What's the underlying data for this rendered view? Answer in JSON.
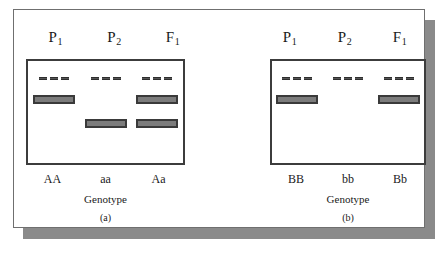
{
  "figure": {
    "panels": [
      {
        "id": "a",
        "caption": "(a)",
        "axis_title": "Genotype",
        "lane_headers": [
          {
            "symbol": "P",
            "subscript": "1"
          },
          {
            "symbol": "P",
            "subscript": "2"
          },
          {
            "symbol": "F",
            "subscript": "1"
          }
        ],
        "lanes": [
          {
            "genotype": "AA",
            "wells": 3,
            "bands": [
              "high"
            ]
          },
          {
            "genotype": "aa",
            "wells": 3,
            "bands": [
              "low"
            ]
          },
          {
            "genotype": "Aa",
            "wells": 3,
            "bands": [
              "high",
              "low"
            ]
          }
        ]
      },
      {
        "id": "b",
        "caption": "(b)",
        "axis_title": "Genotype",
        "lane_headers": [
          {
            "symbol": "P",
            "subscript": "1"
          },
          {
            "symbol": "P",
            "subscript": "2"
          },
          {
            "symbol": "F",
            "subscript": "1"
          }
        ],
        "lanes": [
          {
            "genotype": "BB",
            "wells": 3,
            "bands": [
              "high"
            ]
          },
          {
            "genotype": "bb",
            "wells": 3,
            "bands": []
          },
          {
            "genotype": "Bb",
            "wells": 3,
            "bands": [
              "high"
            ]
          }
        ]
      }
    ],
    "colors": {
      "band_fill": "#7c7c7c",
      "band_border": "#3a3a3a",
      "gel_border": "#3c3c3c",
      "well_mark": "#555555",
      "frame_border": "#6f6f6f",
      "shadow": "#8a8a8a",
      "background": "#ffffff"
    }
  }
}
